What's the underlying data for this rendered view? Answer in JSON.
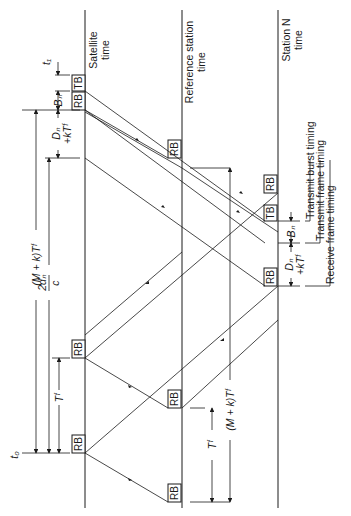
{
  "axes": {
    "satellite": {
      "line1": "Satellite",
      "line2": "time"
    },
    "reference": {
      "line1": "Reference station",
      "line2": "time"
    },
    "station_n": {
      "line1": "Station N",
      "line2": "time"
    }
  },
  "boxes": {
    "tb": "TB",
    "rb": "RB"
  },
  "labels": {
    "t1": "t₁",
    "t0": "t₀",
    "bn_top": "Bₙ",
    "dn_top_a": "Dₙ",
    "dn_top_b": "+kTᶠ",
    "two_dn_num": "2dₙ",
    "two_dn_den": "c",
    "mk_tf_left": "(M + k)Tᶠ",
    "tf_left": "Tᶠ",
    "tf_ref": "Tᶠ",
    "mk_tf_ref": "(M + k)Tᶠ",
    "bn_right": "Bₙ",
    "dn_right_a": "Dₙ",
    "dn_right_b": "+kTᶠ"
  },
  "legend": {
    "transmit_burst": "Transmit burst timing",
    "transmit_frame": "Transmit frame timing",
    "receive_frame": "Receive frame timing"
  }
}
